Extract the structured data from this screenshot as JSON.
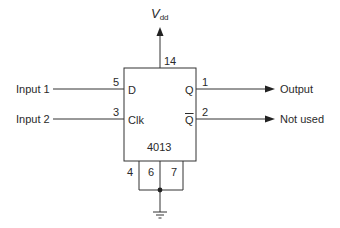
{
  "diagram": {
    "type": "circuit-schematic",
    "chip": {
      "part_number": "4013"
    },
    "supply": {
      "label_main": "V",
      "label_sub": "dd",
      "pin": "14"
    },
    "pins": {
      "d": {
        "label": "D",
        "pin": "5"
      },
      "clk": {
        "label": "Clk",
        "pin": "3"
      },
      "q": {
        "label": "Q",
        "pin": "1"
      },
      "qbar": {
        "label": "Q",
        "pin": "2"
      },
      "bottom": [
        "4",
        "6",
        "7"
      ]
    },
    "inputs": [
      {
        "label": "Input 1",
        "to_pin": "5"
      },
      {
        "label": "Input 2",
        "to_pin": "3"
      }
    ],
    "outputs": [
      {
        "label": "Output",
        "from_pin": "1"
      },
      {
        "label": "Not used",
        "from_pin": "2"
      }
    ],
    "ground": {
      "symbol": "ground-icon",
      "connected_pins": [
        "4",
        "6",
        "7"
      ]
    },
    "colors": {
      "line": "#333333",
      "background": "#ffffff"
    }
  }
}
